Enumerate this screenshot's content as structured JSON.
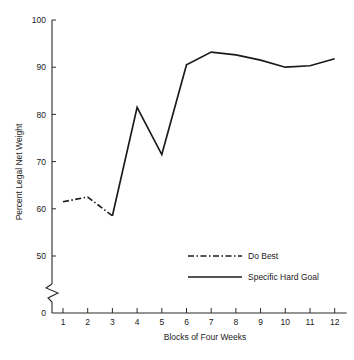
{
  "chart_data": {
    "type": "line",
    "title": "",
    "xlabel": "Blocks of Four Weeks",
    "ylabel": "Percent Legal Net Weight",
    "x": [
      1,
      2,
      3,
      4,
      5,
      6,
      7,
      8,
      9,
      10,
      11,
      12
    ],
    "xticklabels": [
      "1",
      "2",
      "3",
      "4",
      "5",
      "6",
      "7",
      "8",
      "9",
      "10",
      "11",
      "12"
    ],
    "yticklabels": [
      "0",
      "50",
      "60",
      "70",
      "80",
      "90",
      "100"
    ],
    "ytickvalues": [
      0,
      50,
      60,
      70,
      80,
      90,
      100
    ],
    "ylim": [
      50,
      100
    ],
    "xlim": [
      0.6,
      12.4
    ],
    "grid": false,
    "axis_break": true,
    "axis_break_note": "zigzag break on y-axis between 0 and 50",
    "legend_position": "center",
    "series": [
      {
        "name": "Do Best",
        "style": "dash-dot",
        "x": [
          1,
          2,
          3
        ],
        "values": [
          61.5,
          62.5,
          58.5
        ]
      },
      {
        "name": "Specific Hard Goal",
        "style": "solid",
        "x": [
          3,
          4,
          5,
          6,
          7,
          8,
          9,
          10,
          11,
          12
        ],
        "values": [
          58.5,
          81.5,
          71.5,
          90.5,
          93.2,
          92.6,
          91.5,
          90.0,
          90.3,
          91.8
        ]
      }
    ]
  },
  "legend": {
    "items": [
      {
        "label": "Do Best",
        "style": "dash-dot"
      },
      {
        "label": "Specific Hard Goal",
        "style": "solid"
      }
    ]
  },
  "colors": {
    "ink": "#1a1a1a",
    "axis": "#2b2b2b",
    "background": "#ffffff"
  }
}
